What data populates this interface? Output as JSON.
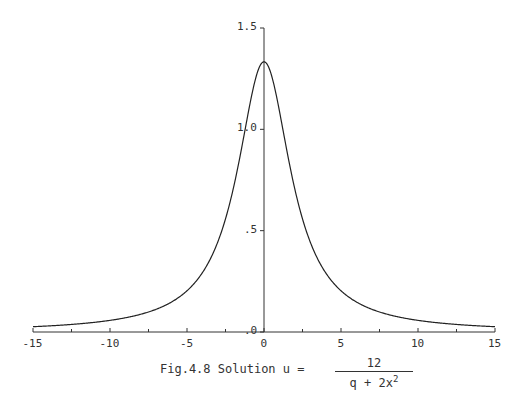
{
  "chart_data": {
    "type": "line",
    "title": "",
    "caption": "Fig.4.8 Solution u = 12 / (q + 2x^2)",
    "xlabel": "",
    "ylabel": "",
    "xlim": [
      -15,
      15
    ],
    "ylim": [
      0,
      1.5
    ],
    "grid": false,
    "legend": null,
    "x_ticks": [
      -15,
      -10,
      -5,
      0,
      5,
      10,
      15
    ],
    "x_minor_ticks": [
      -12.5,
      -7.5,
      -2.5,
      2.5,
      7.5,
      12.5
    ],
    "y_ticks": [
      0,
      0.5,
      1.0,
      1.5
    ],
    "y_tick_labels": [
      ".0",
      ".5",
      "1.0",
      "1.5"
    ],
    "formula": "u = 12/(9 + 2x^2)",
    "parameter_q": 9,
    "series": [
      {
        "name": "u",
        "x": [
          -15,
          -12.5,
          -10,
          -7.5,
          -5,
          -4,
          -3,
          -2,
          -1.5,
          -1,
          -0.5,
          0,
          0.5,
          1,
          1.5,
          2,
          3,
          4,
          5,
          7.5,
          10,
          12.5,
          15
        ],
        "values": [
          0.026,
          0.037,
          0.058,
          0.098,
          0.203,
          0.293,
          0.444,
          0.706,
          0.889,
          1.091,
          1.263,
          1.333,
          1.263,
          1.091,
          0.889,
          0.706,
          0.444,
          0.293,
          0.203,
          0.098,
          0.058,
          0.037,
          0.026
        ]
      }
    ]
  },
  "axes": {
    "x_tick_labels": [
      "-15",
      "-10",
      "-5",
      "0",
      "5",
      "10",
      "15"
    ],
    "y_tick_labels": [
      ".0",
      ".5",
      "1.0",
      "1.5"
    ]
  },
  "caption": {
    "prefix": "Fig.4.8 Solution u =",
    "numerator": "12",
    "denominator": "q + 2x",
    "exponent": "2"
  }
}
